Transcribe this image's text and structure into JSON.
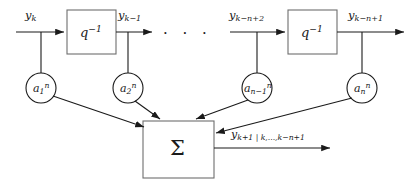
{
  "figure": {
    "type": "block-diagram",
    "background_color": "#ffffff",
    "line_color": "#1a1a1a"
  },
  "signals": {
    "tap_labels": [
      {
        "base": "y",
        "sub": "k",
        "sup": ""
      },
      {
        "base": "y",
        "sub": "k−1",
        "sup": ""
      },
      {
        "base": "y",
        "sub": "k−n+2",
        "sup": ""
      },
      {
        "base": "y",
        "sub": "k−n+1",
        "sup": ""
      }
    ],
    "ellipsis": "·  ·  ·"
  },
  "delay_blocks": [
    {
      "base": "q",
      "sup": "−1",
      "name": "delay-block-1"
    },
    {
      "base": "q",
      "sup": "−1",
      "name": "delay-block-2"
    }
  ],
  "coefficients": [
    {
      "base": "a",
      "sub": "1",
      "sup": "n"
    },
    {
      "base": "a",
      "sub": "2",
      "sup": "n"
    },
    {
      "base": "a",
      "sub": "n−1",
      "sup": "n"
    },
    {
      "base": "a",
      "sub": "n",
      "sup": "n"
    }
  ],
  "summation": {
    "symbol": "Σ"
  },
  "output": {
    "base": "y",
    "sub": "k+1 | k,...,k−n+1"
  }
}
